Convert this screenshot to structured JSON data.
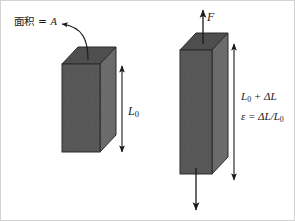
{
  "figure": {
    "background_color": "#ffffff",
    "border_color": "#c8c8c8",
    "labels": {
      "area_label": "面积 = ",
      "area_symbol": "A",
      "original_length_symbol": "L",
      "original_length_subscript": "0",
      "force_symbol": "F",
      "stretched_length": "L",
      "stretched_length_subscript": "0",
      "stretched_length_plus": " + ΔL",
      "strain_symbol": "ε",
      "strain_equation": " = ΔL/L",
      "strain_subscript": "0"
    },
    "blocks": {
      "unstressed": {
        "name": "unstressed-specimen",
        "front_face_color": "#575757",
        "side_face_color": "#6b6b6b",
        "top_face_color": "#4e4e4e",
        "edge_color": "#2e2e2e",
        "front_x": 62,
        "front_y": 64,
        "front_w": 38,
        "front_h": 88,
        "depth_x": 16,
        "depth_y": -17
      },
      "stressed": {
        "name": "stressed-specimen",
        "front_face_color": "#575757",
        "side_face_color": "#6b6b6b",
        "top_face_color": "#4e4e4e",
        "edge_color": "#2e2e2e",
        "front_x": 180,
        "front_y": 50,
        "front_w": 32,
        "front_h": 124,
        "depth_x": 16,
        "depth_y": -17
      }
    },
    "annotations": {
      "callout_arrow": "curved-leader-to-top-face",
      "dimension_arrow_left": "double-headed-vertical-L0",
      "dimension_arrow_right": "double-headed-vertical-L0-plus-dL",
      "force_arrow_top": "upward-force-arrow",
      "force_arrow_bottom": "downward-force-arrow"
    },
    "line_color": "#1a1a1a"
  }
}
